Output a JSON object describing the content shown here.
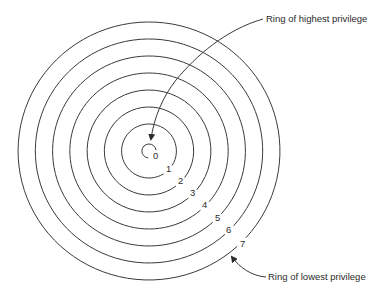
{
  "diagram": {
    "type": "concentric-rings",
    "center": {
      "x": 149,
      "y": 151
    },
    "stroke_color": "#3a3a3a",
    "text_color": "#2a2a2a",
    "background": "#ffffff",
    "rings": [
      {
        "label": "0",
        "r": 7,
        "label_pos": {
          "x": 153,
          "y": 159
        }
      },
      {
        "label": "1",
        "r": 27,
        "label_pos": {
          "x": 166,
          "y": 172
        }
      },
      {
        "label": "2",
        "r": 44,
        "label_pos": {
          "x": 178,
          "y": 184
        }
      },
      {
        "label": "3",
        "r": 61,
        "label_pos": {
          "x": 190,
          "y": 196
        }
      },
      {
        "label": "4",
        "r": 78,
        "label_pos": {
          "x": 202,
          "y": 208
        }
      },
      {
        "label": "5",
        "r": 95,
        "label_pos": {
          "x": 215,
          "y": 221
        }
      },
      {
        "label": "6",
        "r": 112,
        "label_pos": {
          "x": 226,
          "y": 233
        }
      },
      {
        "label": "7",
        "r": 129,
        "label_pos": {
          "x": 240,
          "y": 247
        }
      }
    ],
    "callouts": {
      "highest": {
        "text": "Ring of highest privilege",
        "x": 266,
        "y": 22
      },
      "lowest": {
        "text": "Ring of lowest privilege",
        "x": 268,
        "y": 280
      }
    }
  }
}
